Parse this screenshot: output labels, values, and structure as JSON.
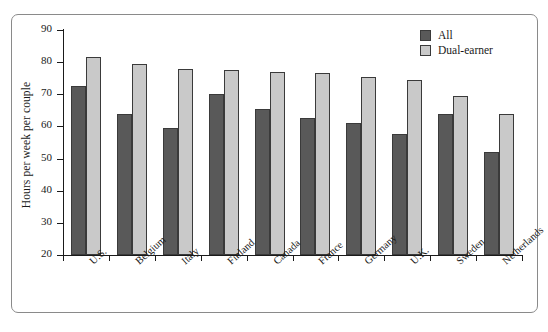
{
  "chart_data": {
    "type": "bar",
    "title": "",
    "xlabel": "",
    "ylabel": "Hours per week per couple",
    "ylim": [
      20,
      90
    ],
    "yticks": [
      20,
      30,
      40,
      50,
      60,
      70,
      80,
      90
    ],
    "grid": false,
    "legend_position": "top-right",
    "categories": [
      "U.S.",
      "Belgium",
      "Italy",
      "Finland",
      "Canada",
      "France",
      "Germany",
      "U.K.",
      "Sweden",
      "Netherlands"
    ],
    "series": [
      {
        "name": "All",
        "color": "#595959",
        "values": [
          72.5,
          64.0,
          59.5,
          70.0,
          65.5,
          62.5,
          61.0,
          57.5,
          64.0,
          52.0
        ]
      },
      {
        "name": "Dual-earner",
        "color": "#c9c9c9",
        "values": [
          81.5,
          79.5,
          78.0,
          77.5,
          77.0,
          76.5,
          75.5,
          74.5,
          69.5,
          64.0
        ]
      }
    ]
  },
  "legend": {
    "items": [
      {
        "label": "All",
        "swatch": "all"
      },
      {
        "label": "Dual-earner",
        "swatch": "dual"
      }
    ]
  }
}
